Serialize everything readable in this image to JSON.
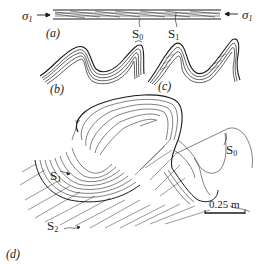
{
  "figure": {
    "panels": [
      {
        "id": "a",
        "label": "(a)",
        "description": "Horizontal layered bed under compression with cleavage S1 oblique to bedding S0"
      },
      {
        "id": "b",
        "label": "(b)",
        "description": "Folded layers, bedding S0"
      },
      {
        "id": "c",
        "label": "(c)",
        "description": "Folded layers with axial planar cleavage S1"
      },
      {
        "id": "d",
        "label": "(d)",
        "description": "Field sketch of refolded fold showing S0, S1 and S2"
      }
    ],
    "labels": {
      "sigma_left": {
        "base": "σ",
        "sub": "1"
      },
      "sigma_right": {
        "base": "σ",
        "sub": "1"
      },
      "s0_top": {
        "base": "S",
        "sub": "0"
      },
      "s1_top": {
        "base": "S",
        "sub": "1"
      },
      "s0_d": {
        "base": "S",
        "sub": "0"
      },
      "s1_d": {
        "base": "S",
        "sub": "1"
      },
      "s2_d": {
        "base": "S",
        "sub": "2"
      }
    },
    "scale_bar": {
      "label": "0.25 m"
    },
    "colors": {
      "ink": "#1a1a1a",
      "background": "#ffffff"
    }
  }
}
